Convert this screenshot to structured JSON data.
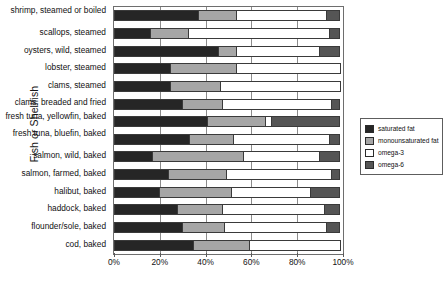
{
  "chart_data": {
    "type": "bar",
    "orientation": "horizontal",
    "stacked": "100%",
    "title": "",
    "xlabel": "",
    "ylabel": "Fish or Shellfish",
    "xlim": [
      0,
      100
    ],
    "xticks": [
      "0%",
      "20%",
      "40%",
      "60%",
      "80%",
      "100%"
    ],
    "xtick_values": [
      0,
      20,
      40,
      60,
      80,
      100
    ],
    "grid": true,
    "legend_position": "right",
    "categories": [
      "shrimp, steamed or boiled",
      "scallops, steamed",
      "oysters, wild, steamed",
      "lobster, steamed",
      "clams, steamed",
      "clams, breaded and fried",
      "fresh tuna, yellowfin, baked",
      "fresh tuna, bluefin, baked",
      "salmon, wild, baked",
      "salmon, farmed, baked",
      "halibut, baked",
      "haddock, baked",
      "flounder/sole, baked",
      "cod, baked"
    ],
    "series": [
      {
        "name": "saturated fat",
        "color": "#262626",
        "values": [
          37,
          16,
          46,
          25,
          25,
          30,
          41,
          33,
          17,
          24,
          20,
          28,
          30,
          35
        ]
      },
      {
        "name": "monounsaturated fat",
        "color": "#a6a6a6",
        "values": [
          17,
          17,
          8,
          29,
          22,
          18,
          26,
          20,
          40,
          26,
          32,
          20,
          19,
          25
        ]
      },
      {
        "name": "omega-3",
        "color": "#ffffff",
        "values": [
          40,
          62,
          37,
          46,
          53,
          48,
          3,
          42,
          34,
          46,
          35,
          45,
          45,
          40
        ]
      },
      {
        "name": "omega-6",
        "color": "#555555",
        "values": [
          6,
          5,
          9,
          0,
          0,
          4,
          30,
          5,
          9,
          4,
          13,
          7,
          6,
          0
        ]
      }
    ]
  },
  "legend": {
    "items": [
      {
        "label": "saturated fat",
        "color": "#262626"
      },
      {
        "label": "monounsaturated fat",
        "color": "#a6a6a6"
      },
      {
        "label": "omega-3",
        "color": "#ffffff"
      },
      {
        "label": "omega-6",
        "color": "#555555"
      }
    ]
  }
}
